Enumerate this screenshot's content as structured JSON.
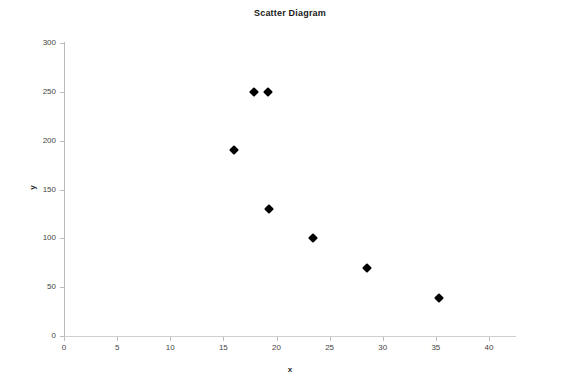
{
  "chart_data": {
    "type": "scatter",
    "title": "Scatter Diagram",
    "xlabel": "x",
    "ylabel": "y",
    "xlim": [
      0,
      40
    ],
    "ylim": [
      0,
      300
    ],
    "xticks": [
      0,
      5,
      10,
      15,
      20,
      25,
      30,
      35,
      40
    ],
    "yticks": [
      0,
      50,
      100,
      150,
      200,
      250,
      300
    ],
    "grid": false,
    "legend": null,
    "marker": "diamond",
    "marker_color": "#000000",
    "points": [
      {
        "x": 16.0,
        "y": 190
      },
      {
        "x": 17.9,
        "y": 250
      },
      {
        "x": 19.2,
        "y": 250
      },
      {
        "x": 19.3,
        "y": 130
      },
      {
        "x": 23.4,
        "y": 100
      },
      {
        "x": 28.5,
        "y": 70
      },
      {
        "x": 35.3,
        "y": 39
      }
    ]
  },
  "axes": {
    "x_tick_labels": [
      "0",
      "5",
      "10",
      "15",
      "20",
      "25",
      "30",
      "35",
      "40"
    ],
    "y_tick_labels": [
      "0",
      "50",
      "100",
      "150",
      "200",
      "250",
      "300"
    ],
    "x_title": "x",
    "y_title": "y"
  },
  "header": {
    "title": "Scatter Diagram"
  },
  "colors": {
    "background": "#ffffff",
    "axis": "#bdbdbd",
    "text": "#333333",
    "marker": "#0a0a0a"
  }
}
